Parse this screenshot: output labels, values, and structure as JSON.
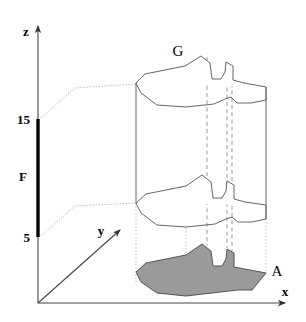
{
  "figure": {
    "background_color": "#ffffff",
    "width": 306,
    "height": 322
  },
  "axes": {
    "origin": {
      "x": 38,
      "y": 303
    },
    "x_axis": {
      "label": "x",
      "label_pos": {
        "x": 288,
        "y": 295
      },
      "from": {
        "x": 38,
        "y": 303
      },
      "to": {
        "x": 287,
        "y": 303
      },
      "color": "#444444"
    },
    "y_axis": {
      "label": "y",
      "label_pos": {
        "x": 101,
        "y": 233
      },
      "from": {
        "x": 38,
        "y": 303
      },
      "to": {
        "x": 123,
        "y": 227
      },
      "color": "#444444"
    },
    "z_axis": {
      "label": "z",
      "label_pos": {
        "x": 26,
        "y": 35
      },
      "from": {
        "x": 38,
        "y": 303
      },
      "to": {
        "x": 38,
        "y": 23
      },
      "color": "#444444"
    }
  },
  "ticks": [
    {
      "label": "15",
      "value": 15,
      "pos": {
        "x": 38,
        "y": 119
      },
      "label_pos": {
        "x": 30,
        "y": 124
      }
    },
    {
      "label": "5",
      "value": 5,
      "pos": {
        "x": 38,
        "y": 237
      },
      "label_pos": {
        "x": 30,
        "y": 242
      }
    }
  ],
  "interval": {
    "label": "F",
    "label_pos": {
      "x": 24,
      "y": 176
    },
    "from": {
      "x": 38,
      "y": 119
    },
    "to": {
      "x": 38,
      "y": 237
    },
    "color": "#000000",
    "stroke_width": 3.2
  },
  "labels": {
    "top_region": {
      "text": "G",
      "pos": {
        "x": 178,
        "y": 55
      }
    },
    "base_region": {
      "text": "A",
      "pos": {
        "x": 275,
        "y": 274
      }
    }
  },
  "colors": {
    "base_fill": "#9a9a9a",
    "outline": "#555555",
    "dashed": "#888888",
    "dotted": "#aaaaaa",
    "axis": "#444444",
    "text": "#000000"
  },
  "geometry": {
    "top_face": "M136,83 L144,75 L164,71 L183,67 L200,56 L210,63 L212,78 L220,78 L224,73 L226,62 L233,65 L233,79 L243,82 L266,86",
    "top_face_lower": "M136,83 L141,93 L156,105 L185,107 L213,104 L224,99 L230,97 L236,103 L250,103 L266,100 L266,86",
    "mid_face": "M136,203 L146,195 L166,191 L186,186 L201,175 L211,183 L214,197 L221,197 L225,191 L227,180 L234,184 L234,198 L244,201 L266,205",
    "mid_face_lower": "M136,203 L141,213 L156,225 L186,227 L214,224 L225,219 L231,217 L237,222 L251,222 L266,219 L266,205",
    "left_edge": {
      "x1": 136,
      "y1": 83,
      "x2": 136,
      "y2": 203
    },
    "right_edge": {
      "x1": 266,
      "y1": 86,
      "x2": 266,
      "y2": 219
    },
    "base_polygon": "M136,272 L146,263 L166,259 L186,254 L201,243 L211,251 L214,265 L221,265 L225,259 L227,248 L234,252 L234,266 L266,272 L251,290 L237,290 L186,295 L156,293 L141,281 Z",
    "dashed_lines": [
      {
        "x": 207,
        "y1": 57,
        "y2": 244
      },
      {
        "x": 227,
        "y1": 64,
        "y2": 248
      },
      {
        "x": 232,
        "y1": 66,
        "y2": 250
      }
    ],
    "dotted_verticals": [
      {
        "x": 136,
        "y1": 203,
        "y2": 281
      },
      {
        "x": 186,
        "y1": 227,
        "y2": 296
      },
      {
        "x": 207,
        "y1": 244,
        "y2": 292
      },
      {
        "x": 234,
        "y1": 250,
        "y2": 290
      },
      {
        "x": 266,
        "y1": 219,
        "y2": 273
      }
    ],
    "projector_upper": "M40,119 L74,88 L136,83",
    "projector_lower": "M40,237 L74,206 L136,203"
  }
}
